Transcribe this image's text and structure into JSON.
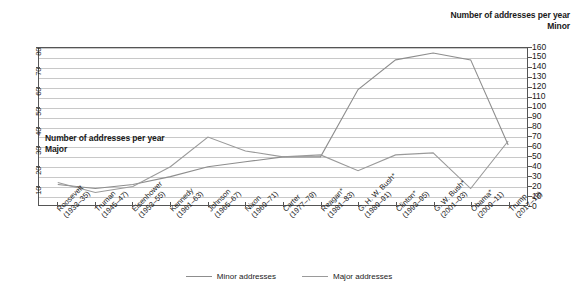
{
  "axis_titles": {
    "right_line1": "Number of addresses per year",
    "right_line2": "Minor",
    "left_line1": "Number of addresses per year",
    "left_line2": "Major"
  },
  "legend": {
    "items": [
      {
        "label": "Minor addresses",
        "color": "#8d8d8d"
      },
      {
        "label": "Major addresses",
        "color": "#9a9a9a"
      }
    ]
  },
  "chart_data": {
    "type": "line",
    "title": "",
    "xlabel": "",
    "ylabel": "Number of addresses per year",
    "grid": true,
    "legend_position": "bottom-center",
    "categories": [
      "Roosevelt\n(1933–35)",
      "Truman\n(1945–47)",
      "Eisenhower\n(1953–55)",
      "Kennedy\n(1961–63)",
      "Johnson\n(1965–67)",
      "Nixon\n(1969–71)",
      "Carter\n(1977–79)",
      "Reagan*\n(1981–83)",
      "G. H. W. Bush*\n(1989–91)",
      "Clinton*\n(1993–95)",
      "G. W. Bush*\n(2001–03)",
      "Obama*\n(2009–11)",
      "Trump\n(2017–19)"
    ],
    "category_lines": [
      [
        "Roosevelt",
        "(1933–35)"
      ],
      [
        "Truman",
        "(1945–47)"
      ],
      [
        "Eisenhower",
        "(1953–55)"
      ],
      [
        "Kennedy",
        "(1961–63)"
      ],
      [
        "Johnson",
        "(1965–67)"
      ],
      [
        "Nixon",
        "(1969–71)"
      ],
      [
        "Carter",
        "(1977–79)"
      ],
      [
        "Reagan*",
        "(1981–83)"
      ],
      [
        "G. H. W. Bush*",
        "(1989–91)"
      ],
      [
        "Clinton*",
        "(1993–95)"
      ],
      [
        "G. W. Bush*",
        "(2001–03)"
      ],
      [
        "Obama*",
        "(2009–11)"
      ],
      [
        "Trump",
        "(2017–19)"
      ]
    ],
    "series": [
      {
        "name": "Minor addresses",
        "axis": "right",
        "color": "#8d8d8d",
        "values": [
          22,
          18,
          22,
          30,
          40,
          45,
          50,
          50,
          118,
          148,
          155,
          148,
          62
        ]
      },
      {
        "name": "Major addresses",
        "axis": "left",
        "color": "#9a9a9a",
        "values": [
          12,
          7,
          10,
          20,
          35,
          28,
          25,
          26,
          18,
          26,
          27,
          9,
          33
        ]
      }
    ],
    "y_right": {
      "label": "Minor",
      "min": 0,
      "max": 160,
      "step": 10,
      "ticks": [
        160,
        150,
        140,
        130,
        120,
        110,
        100,
        90,
        80,
        70,
        60,
        50,
        40,
        30,
        20,
        10,
        0
      ]
    },
    "y_left": {
      "label": "Major",
      "min": 0,
      "max": 80,
      "step": 10,
      "ticks": [
        80,
        70,
        60,
        50,
        40,
        30,
        20,
        10
      ]
    }
  }
}
